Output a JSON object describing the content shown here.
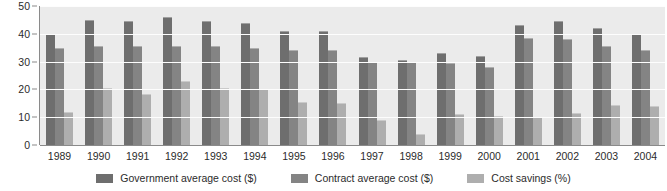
{
  "chart_data": {
    "type": "bar",
    "title": "",
    "subtitle": "",
    "xlabel": "",
    "ylabel": "",
    "ylim": [
      0,
      50
    ],
    "yticks": [
      0,
      10,
      20,
      30,
      40,
      50
    ],
    "grid": true,
    "legend_position": "bottom",
    "orientation": "vertical",
    "grouped": true,
    "categories": [
      "1989",
      "1990",
      "1991",
      "1992",
      "1993",
      "1994",
      "1995",
      "1996",
      "1997",
      "1998",
      "1999",
      "2000",
      "2001",
      "2002",
      "2003",
      "2004"
    ],
    "series": [
      {
        "name": "Government average cost ($)",
        "color": "#6e6e6e",
        "values": [
          40,
          45,
          44.5,
          46,
          44.5,
          44,
          41,
          41,
          31.5,
          30.5,
          33,
          32,
          43,
          44.5,
          42,
          40
        ]
      },
      {
        "name": "Contract average cost ($)",
        "color": "#848484",
        "values": [
          35,
          35.5,
          35.5,
          35.5,
          35.5,
          35,
          34,
          34,
          30,
          30,
          29.5,
          28,
          38.5,
          38,
          35.5,
          34
        ]
      },
      {
        "name": "Cost savings (%)",
        "color": "#aeaeae",
        "values": [
          12,
          20.5,
          18.5,
          23,
          20.5,
          20,
          15.5,
          15,
          9,
          4,
          11,
          10.5,
          10,
          11.5,
          14.5,
          14
        ]
      }
    ]
  },
  "legend": {
    "items": [
      {
        "label": "Government average cost ($)",
        "color": "#6e6e6e"
      },
      {
        "label": "Contract average cost ($)",
        "color": "#848484"
      },
      {
        "label": "Cost savings (%)",
        "color": "#aeaeae"
      }
    ]
  },
  "colors": {
    "plot_background": "#ebebeb",
    "page_background": "#ffffff",
    "gridline": "#fdfdfd",
    "axis": "#8a8a8a",
    "text": "#2b2b2b"
  }
}
